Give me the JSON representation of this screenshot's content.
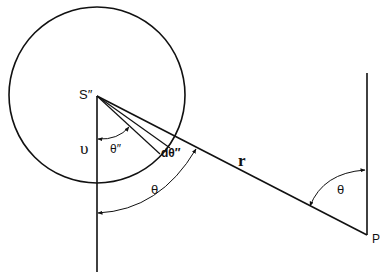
{
  "diagram": {
    "labels": {
      "source": "S″",
      "upsilon": "υ",
      "theta_pp": "θ″",
      "dtheta_pp": "dθ″",
      "r": "r",
      "theta_lower": "θ",
      "theta_right": "θ",
      "point": "P"
    },
    "geometry": {
      "circle": {
        "cx": 97,
        "cy": 95,
        "r": 88
      },
      "source_point": [
        97,
        96
      ],
      "field_point": [
        367,
        235
      ],
      "stroke_color": "#111111"
    }
  }
}
